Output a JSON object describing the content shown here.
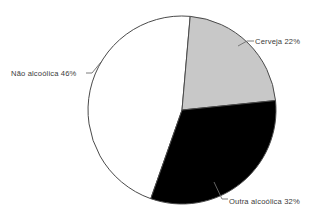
{
  "chart_data": {
    "type": "pie",
    "title": "",
    "subtitle": "",
    "xlabel": "",
    "ylabel": "",
    "legend_position": "none",
    "grid": false,
    "labels_format": "{name} {value}%",
    "categories": [
      "Cerveja",
      "Outra alcoólica",
      "Não alcoólica"
    ],
    "values": [
      22,
      32,
      46
    ],
    "units": "%",
    "slices": [
      {
        "name": "Cerveja",
        "value": 22,
        "label": "Cerveja 22%",
        "color": "#c8c8c8",
        "start_angle_deg": 5,
        "end_angle_deg": 84.2
      },
      {
        "name": "Outra alcoólica",
        "value": 32,
        "label": "Outra alcoólica 32%",
        "color": "#000000",
        "start_angle_deg": 84.2,
        "end_angle_deg": 199.4
      },
      {
        "name": "Não alcoólica",
        "value": 46,
        "label": "Não alcoólica 46%",
        "color": "#ffffff",
        "start_angle_deg": 199.4,
        "end_angle_deg": 365
      }
    ],
    "geometry": {
      "center_x": 182,
      "center_y": 110,
      "radius": 94,
      "start_angle_offset_deg": 5,
      "direction": "clockwise"
    },
    "style": {
      "background": "#ffffff",
      "outline_color": "#4a4a4a",
      "leader_color": "#6e6e6e",
      "text_color": "#3b3b3b"
    }
  },
  "labels": {
    "cerveja": "Cerveja 22%",
    "nao_alcoolica": "Não alcoólica 46%",
    "outra_alcoolica": "Outra alcoólica 32%"
  }
}
